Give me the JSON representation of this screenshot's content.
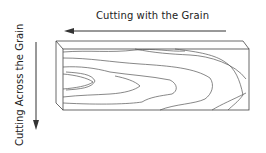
{
  "diagram": {
    "labels": {
      "with_grain": "Cutting with the Grain",
      "across_grain": "Cutting Across the Grain"
    },
    "arrows": [
      {
        "name": "with-grain-arrow",
        "direction": "left"
      },
      {
        "name": "across-grain-arrow",
        "direction": "down"
      }
    ],
    "object": "wood-board",
    "colors": {
      "line": "#333333",
      "text": "#222222",
      "background": "#ffffff"
    }
  }
}
